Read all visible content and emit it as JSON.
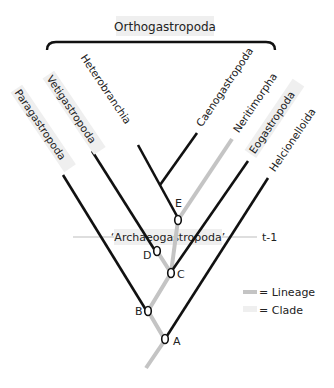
{
  "title": "Orthogastropoda",
  "colors": {
    "clade_line": "#111111",
    "lineage_line": "#c4c4c4",
    "clade_band": "#eeeeee",
    "timeline": "#bdbdbd",
    "text": "#222222"
  },
  "taxa": [
    {
      "id": "paragastropoda",
      "label": "Paragastropoda",
      "type": "clade"
    },
    {
      "id": "vetigastropoda",
      "label": "Vetigastropoda",
      "type": "clade"
    },
    {
      "id": "heterobranchia",
      "label": "Heterobranchia",
      "type": "clade"
    },
    {
      "id": "caenogastropoda",
      "label": "Caenogastropoda",
      "type": "clade"
    },
    {
      "id": "neritimorpha",
      "label": "Neritimorpha",
      "type": "lineage"
    },
    {
      "id": "eogastropoda",
      "label": "Eogastropoda",
      "type": "clade"
    },
    {
      "id": "helcionelloida",
      "label": "Helcionelloida",
      "type": "clade"
    }
  ],
  "nodes": [
    {
      "id": "A",
      "label": "A"
    },
    {
      "id": "B",
      "label": "B"
    },
    {
      "id": "C",
      "label": "C"
    },
    {
      "id": "D",
      "label": "D"
    },
    {
      "id": "E",
      "label": "E"
    }
  ],
  "paraphyletic_group": "‘Archaeogastropoda’",
  "time_marker": "t-1",
  "legend": [
    {
      "label": "= Lineage",
      "kind": "lineage"
    },
    {
      "label": "= Clade",
      "kind": "clade"
    }
  ]
}
